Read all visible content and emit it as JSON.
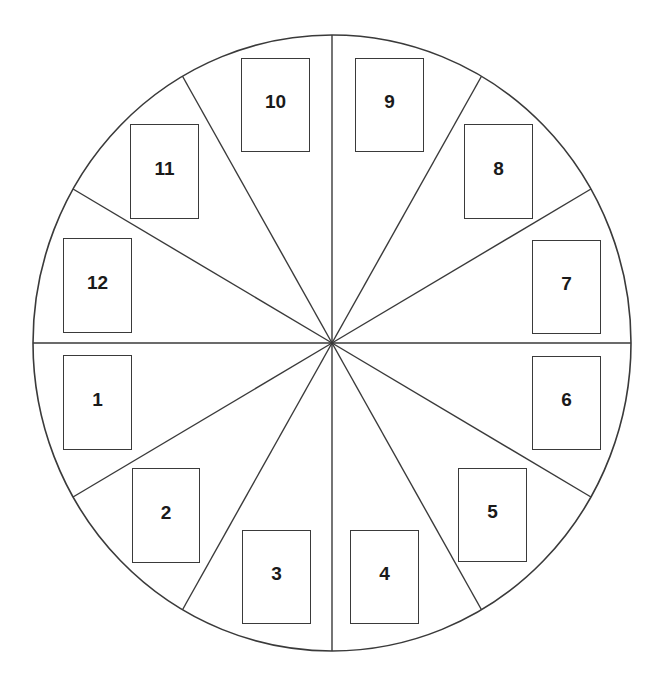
{
  "diagram": {
    "type": "circular-spread",
    "sectors": 12,
    "center": {
      "x": 332,
      "y": 343
    },
    "radius": {
      "rx": 299,
      "ry": 308
    },
    "spoke_angles_deg": [
      0,
      30,
      60,
      90,
      120,
      150,
      180,
      210,
      240,
      270,
      300,
      330
    ],
    "colors": {
      "line": "#3a3a3a",
      "background": "#ffffff",
      "text": "#1a1a1a"
    },
    "slots": [
      {
        "label": "1",
        "x": 63,
        "y": 355,
        "w": 69,
        "h": 95
      },
      {
        "label": "2",
        "x": 132,
        "y": 468,
        "w": 68,
        "h": 95
      },
      {
        "label": "3",
        "x": 242,
        "y": 530,
        "w": 69,
        "h": 94
      },
      {
        "label": "4",
        "x": 350,
        "y": 530,
        "w": 69,
        "h": 94
      },
      {
        "label": "5",
        "x": 458,
        "y": 468,
        "w": 69,
        "h": 94
      },
      {
        "label": "6",
        "x": 532,
        "y": 356,
        "w": 69,
        "h": 94
      },
      {
        "label": "7",
        "x": 532,
        "y": 240,
        "w": 69,
        "h": 94
      },
      {
        "label": "8",
        "x": 464,
        "y": 124,
        "w": 69,
        "h": 95
      },
      {
        "label": "9",
        "x": 355,
        "y": 58,
        "w": 69,
        "h": 94
      },
      {
        "label": "10",
        "x": 241,
        "y": 58,
        "w": 69,
        "h": 94
      },
      {
        "label": "11",
        "x": 130,
        "y": 124,
        "w": 69,
        "h": 95
      },
      {
        "label": "12",
        "x": 63,
        "y": 238,
        "w": 69,
        "h": 95
      }
    ]
  }
}
